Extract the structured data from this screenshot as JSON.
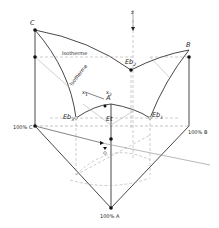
{
  "diagram": {
    "type": "ternary-phase-diagram-3d",
    "labels": {
      "top_C": "C",
      "top_B": "B",
      "top_A": "A",
      "axis_z": "z",
      "isotherm_h": "Isotherme",
      "isotherm_d": "Isotherme",
      "eb2": "Eb",
      "eb2_sub": "2",
      "eb1": "Eb",
      "eb1_sub": "1",
      "eb3": "Eb",
      "eb3_sub": "3",
      "et": "Et",
      "x1": "x",
      "x1_sub": "1",
      "x2": "x",
      "x2_sub": "2",
      "base_C": "100% C",
      "base_B": "100% B",
      "base_A": "100% A"
    },
    "colors": {
      "line": "#333333",
      "dashed": "#9a9a9a",
      "thin": "#b0b0b0",
      "point": "#111111"
    }
  }
}
